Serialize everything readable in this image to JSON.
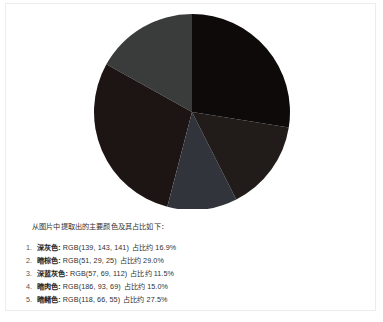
{
  "card": {
    "caption": "从图片中提取出的主要颜色及其占比如下："
  },
  "legend": {
    "items": [
      {
        "index": "1.",
        "name": "深灰色:",
        "rgb": "RGB(139, 143, 141)",
        "share": "占比约 16.9%",
        "swatch": "#8b8f8d",
        "slice_fill": "#3a3c3b"
      },
      {
        "index": "2.",
        "name": "暗棕色:",
        "rgb": "RGB(51, 29, 25)",
        "share": "占比约 29.0%",
        "swatch": "#331d19",
        "slice_fill": "#1c1513"
      },
      {
        "index": "3.",
        "name": "深蓝灰色:",
        "rgb": "RGB(57, 69, 112)",
        "share": "占比约 11.5%",
        "swatch": "#394570",
        "slice_fill": "#32343c"
      },
      {
        "index": "4.",
        "name": "暗肉色:",
        "rgb": "RGB(186, 93, 69)",
        "share": "占比约 15.0%",
        "swatch": "#ba5d45",
        "slice_fill": "#211b19"
      },
      {
        "index": "5.",
        "name": "暗赭色:",
        "rgb": "RGB(118, 66, 55)",
        "share": "占比约 27.5%",
        "swatch": "#764237",
        "slice_fill": "#0d0a09"
      }
    ]
  },
  "chart_data": {
    "type": "pie",
    "title": "",
    "labels": [
      "深灰色",
      "暗棕色",
      "深蓝灰色",
      "暗肉色",
      "暗赭色"
    ],
    "values": [
      16.9,
      29.0,
      11.5,
      15.0,
      27.5
    ],
    "value_unit": "%",
    "rgb_values": [
      "RGB(139, 143, 141)",
      "RGB(51, 29, 25)",
      "RGB(57, 69, 112)",
      "RGB(186, 93, 69)",
      "RGB(118, 66, 55)"
    ],
    "colors": [
      "#3a3c3b",
      "#1c1513",
      "#32343c",
      "#211b19",
      "#0d0a09"
    ],
    "start_angle_deg": 0,
    "direction": "counterclockwise",
    "legend": "below",
    "grid": false,
    "labels_shown": false
  }
}
